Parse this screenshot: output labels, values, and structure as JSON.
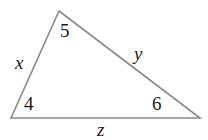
{
  "figure": {
    "type": "triangle-diagram",
    "background_color": "#ffffff",
    "stroke_color": "#8a8a8a",
    "text_color": "#1a1a1a",
    "width": 208,
    "height": 140
  },
  "geometry": {
    "vertices": {
      "apex": {
        "name": "top-vertex",
        "x": 59,
        "y": 11
      },
      "left": {
        "name": "bottom-left-vertex",
        "x": 11,
        "y": 118
      },
      "right": {
        "name": "bottom-right-vertex",
        "x": 200,
        "y": 118
      }
    },
    "polygon_points": "59,11 200,118 11,118"
  },
  "labels": {
    "angle_top": "5",
    "angle_bottom_left": "4",
    "angle_bottom_right": "6",
    "side_left": "x",
    "side_right": "y",
    "side_bottom": "z"
  },
  "chart_data": {
    "type": "diagram",
    "title": "",
    "shape": "triangle",
    "angles": [
      {
        "id": "top",
        "label": "5",
        "vertex": [
          59,
          11
        ]
      },
      {
        "id": "bottom-left",
        "label": "4",
        "vertex": [
          11,
          118
        ]
      },
      {
        "id": "bottom-right",
        "label": "6",
        "vertex": [
          200,
          118
        ]
      }
    ],
    "sides": [
      {
        "id": "left",
        "label": "x",
        "from": "bottom-left",
        "to": "top",
        "style": "italic"
      },
      {
        "id": "right",
        "label": "y",
        "from": "top",
        "to": "bottom-right",
        "style": "italic"
      },
      {
        "id": "bottom",
        "label": "z",
        "from": "bottom-left",
        "to": "bottom-right",
        "style": "italic"
      }
    ]
  }
}
